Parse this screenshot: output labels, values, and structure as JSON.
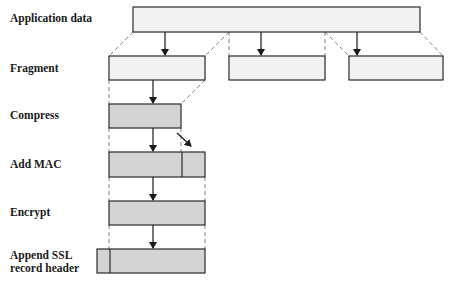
{
  "diagram": {
    "colors": {
      "light_fill": "#f2f2f2",
      "shaded_fill": "#d4d4d4",
      "stroke": "#2b2b2b",
      "dashed": "#666666"
    },
    "stages": [
      {
        "id": "application-data",
        "label": "Application data",
        "label_y": 18
      },
      {
        "id": "fragment",
        "label": "Fragment",
        "label_y": 62
      },
      {
        "id": "compress",
        "label": "Compress",
        "label_y": 110
      },
      {
        "id": "add-mac",
        "label": "Add MAC",
        "label_y": 158
      },
      {
        "id": "encrypt",
        "label": "Encrypt",
        "label_y": 206
      },
      {
        "id": "append-ssl-header",
        "label": "Append SSL\nrecord header",
        "label_y": 249
      }
    ],
    "boxes": {
      "application_data": {
        "x": 133,
        "y": 7,
        "w": 287,
        "h": 25
      },
      "fragments": [
        {
          "x": 109,
          "y": 56,
          "w": 96,
          "h": 24
        },
        {
          "x": 229,
          "y": 56,
          "w": 96,
          "h": 24
        },
        {
          "x": 349,
          "y": 56,
          "w": 94,
          "h": 24
        }
      ],
      "compress": {
        "x": 109,
        "y": 104,
        "w": 72,
        "h": 24
      },
      "add_mac": {
        "x": 109,
        "y": 152,
        "w": 96,
        "h": 25,
        "divider_x": 182
      },
      "encrypt": {
        "x": 109,
        "y": 201,
        "w": 96,
        "h": 24
      },
      "ssl_record": {
        "x": 97,
        "y": 249,
        "w": 108,
        "h": 24,
        "divider_x": 110
      }
    }
  }
}
